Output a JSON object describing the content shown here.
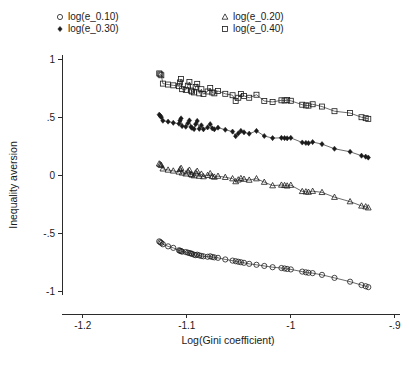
{
  "chart_data": {
    "type": "scatter",
    "title": "",
    "xlabel": "Log(Gini coefficient)",
    "ylabel": "Inequality aversion",
    "xlim": [
      -1.22,
      -0.895
    ],
    "ylim": [
      -1.12,
      1.08
    ],
    "xticks": [
      -1.2,
      -1.1,
      -1.0,
      -0.9
    ],
    "xtick_labels": [
      "-1.2",
      "-1.1",
      "-1",
      "-.9"
    ],
    "yticks": [
      1.0,
      0.5,
      0.0,
      -0.5,
      -1.0
    ],
    "ytick_labels": [
      "1",
      ".5",
      "0",
      "-.5",
      "-1"
    ],
    "grid": false,
    "legend_position": "top",
    "series": [
      {
        "name": "log(e_0.10)",
        "marker": "circle-open",
        "legend_column": "left",
        "legend_row": 1,
        "points": [
          [
            -1.1265,
            -0.571
          ],
          [
            -1.1255,
            -0.578
          ],
          [
            -1.1245,
            -0.585
          ],
          [
            -1.123,
            -0.596
          ],
          [
            -1.118,
            -0.614
          ],
          [
            -1.113,
            -0.627
          ],
          [
            -1.1075,
            -0.648
          ],
          [
            -1.1065,
            -0.652
          ],
          [
            -1.1055,
            -0.655
          ],
          [
            -1.1045,
            -0.66
          ],
          [
            -1.101,
            -0.663
          ],
          [
            -1.099,
            -0.668
          ],
          [
            -1.0975,
            -0.672
          ],
          [
            -1.096,
            -0.675
          ],
          [
            -1.095,
            -0.679
          ],
          [
            -1.093,
            -0.686
          ],
          [
            -1.0915,
            -0.69
          ],
          [
            -1.09,
            -0.686
          ],
          [
            -1.088,
            -0.692
          ],
          [
            -1.086,
            -0.697
          ],
          [
            -1.084,
            -0.7
          ],
          [
            -1.08,
            -0.704
          ],
          [
            -1.0775,
            -0.7
          ],
          [
            -1.0755,
            -0.706
          ],
          [
            -1.0735,
            -0.709
          ],
          [
            -1.07,
            -0.713
          ],
          [
            -1.063,
            -0.727
          ],
          [
            -1.056,
            -0.737
          ],
          [
            -1.053,
            -0.742
          ],
          [
            -1.0505,
            -0.747
          ],
          [
            -1.048,
            -0.751
          ],
          [
            -1.045,
            -0.756
          ],
          [
            -1.04,
            -0.765
          ],
          [
            -1.033,
            -0.773
          ],
          [
            -1.0255,
            -0.783
          ],
          [
            -1.0175,
            -0.794
          ],
          [
            -1.009,
            -0.801
          ],
          [
            -1.006,
            -0.805
          ],
          [
            -1.0035,
            -0.809
          ],
          [
            -1.0,
            -0.813
          ],
          [
            -0.989,
            -0.832
          ],
          [
            -0.9855,
            -0.838
          ],
          [
            -0.983,
            -0.842
          ],
          [
            -0.979,
            -0.845
          ],
          [
            -0.97,
            -0.86
          ],
          [
            -0.958,
            -0.886
          ],
          [
            -0.943,
            -0.919
          ],
          [
            -0.932,
            -0.948
          ],
          [
            -0.928,
            -0.958
          ],
          [
            -0.9255,
            -0.966
          ]
        ]
      },
      {
        "name": "log(e_0.20)",
        "marker": "triangle-open",
        "legend_column": "right",
        "legend_row": 1,
        "points": [
          [
            -1.1265,
            0.098
          ],
          [
            -1.1255,
            0.092
          ],
          [
            -1.1245,
            0.085
          ],
          [
            -1.123,
            0.055
          ],
          [
            -1.118,
            0.045
          ],
          [
            -1.113,
            0.037
          ],
          [
            -1.1075,
            0.028
          ],
          [
            -1.1065,
            0.05
          ],
          [
            -1.1055,
            0.06
          ],
          [
            -1.1045,
            0.02
          ],
          [
            -1.101,
            0.012
          ],
          [
            -1.099,
            0.03
          ],
          [
            -1.0975,
            0.044
          ],
          [
            -1.096,
            0.008
          ],
          [
            -1.095,
            0.002
          ],
          [
            -1.093,
            -0.004
          ],
          [
            -1.0915,
            0.02
          ],
          [
            -1.09,
            0.035
          ],
          [
            -1.088,
            -0.008
          ],
          [
            -1.086,
            0.01
          ],
          [
            -1.084,
            -0.012
          ],
          [
            -1.08,
            -0.001
          ],
          [
            -1.0775,
            0.014
          ],
          [
            -1.0755,
            -0.01
          ],
          [
            -1.0735,
            -0.016
          ],
          [
            -1.07,
            -0.008
          ],
          [
            -1.063,
            -0.018
          ],
          [
            -1.056,
            -0.03
          ],
          [
            -1.053,
            -0.055
          ],
          [
            -1.0505,
            -0.04
          ],
          [
            -1.048,
            -0.028
          ],
          [
            -1.045,
            -0.034
          ],
          [
            -1.04,
            -0.042
          ],
          [
            -1.033,
            -0.03
          ],
          [
            -1.0255,
            -0.06
          ],
          [
            -1.0175,
            -0.09
          ],
          [
            -1.009,
            -0.085
          ],
          [
            -1.006,
            -0.088
          ],
          [
            -1.0035,
            -0.092
          ],
          [
            -1.0,
            -0.086
          ],
          [
            -0.989,
            -0.14
          ],
          [
            -0.9855,
            -0.143
          ],
          [
            -0.983,
            -0.146
          ],
          [
            -0.979,
            -0.138
          ],
          [
            -0.97,
            -0.148
          ],
          [
            -0.958,
            -0.19
          ],
          [
            -0.943,
            -0.228
          ],
          [
            -0.932,
            -0.265
          ],
          [
            -0.928,
            -0.272
          ],
          [
            -0.9255,
            -0.281
          ]
        ]
      },
      {
        "name": "log(e_0.30)",
        "marker": "diamond-filled",
        "legend_column": "left",
        "legend_row": 2,
        "points": [
          [
            -1.1265,
            0.522
          ],
          [
            -1.1255,
            0.512
          ],
          [
            -1.1245,
            0.5
          ],
          [
            -1.123,
            0.47
          ],
          [
            -1.118,
            0.462
          ],
          [
            -1.113,
            0.452
          ],
          [
            -1.1075,
            0.444
          ],
          [
            -1.1065,
            0.472
          ],
          [
            -1.1055,
            0.49
          ],
          [
            -1.1045,
            0.424
          ],
          [
            -1.101,
            0.418
          ],
          [
            -1.099,
            0.448
          ],
          [
            -1.0975,
            0.472
          ],
          [
            -1.096,
            0.416
          ],
          [
            -1.095,
            0.408
          ],
          [
            -1.093,
            0.398
          ],
          [
            -1.0915,
            0.44
          ],
          [
            -1.09,
            0.468
          ],
          [
            -1.088,
            0.4
          ],
          [
            -1.086,
            0.43
          ],
          [
            -1.084,
            0.396
          ],
          [
            -1.08,
            0.412
          ],
          [
            -1.0775,
            0.44
          ],
          [
            -1.0755,
            0.404
          ],
          [
            -1.0735,
            0.396
          ],
          [
            -1.07,
            0.41
          ],
          [
            -1.063,
            0.392
          ],
          [
            -1.056,
            0.376
          ],
          [
            -1.053,
            0.336
          ],
          [
            -1.0505,
            0.36
          ],
          [
            -1.048,
            0.382
          ],
          [
            -1.045,
            0.37
          ],
          [
            -1.04,
            0.358
          ],
          [
            -1.033,
            0.382
          ],
          [
            -1.0255,
            0.338
          ],
          [
            -1.0175,
            0.32
          ],
          [
            -1.009,
            0.322
          ],
          [
            -1.006,
            0.32
          ],
          [
            -1.0035,
            0.318
          ],
          [
            -1.0,
            0.322
          ],
          [
            -0.989,
            0.282
          ],
          [
            -0.9855,
            0.278
          ],
          [
            -0.983,
            0.276
          ],
          [
            -0.979,
            0.286
          ],
          [
            -0.97,
            0.268
          ],
          [
            -0.958,
            0.228
          ],
          [
            -0.943,
            0.202
          ],
          [
            -0.932,
            0.168
          ],
          [
            -0.928,
            0.16
          ],
          [
            -0.9255,
            0.152
          ]
        ]
      },
      {
        "name": "log(e_0.40)",
        "marker": "square-open",
        "legend_column": "right",
        "legend_row": 2,
        "points": [
          [
            -1.1265,
            0.878
          ],
          [
            -1.1255,
            0.87
          ],
          [
            -1.1245,
            0.862
          ],
          [
            -1.123,
            0.79
          ],
          [
            -1.118,
            0.782
          ],
          [
            -1.113,
            0.775
          ],
          [
            -1.1075,
            0.768
          ],
          [
            -1.1065,
            0.8
          ],
          [
            -1.1055,
            0.83
          ],
          [
            -1.1045,
            0.742
          ],
          [
            -1.101,
            0.736
          ],
          [
            -1.099,
            0.772
          ],
          [
            -1.0975,
            0.804
          ],
          [
            -1.096,
            0.73
          ],
          [
            -1.095,
            0.722
          ],
          [
            -1.093,
            0.714
          ],
          [
            -1.0915,
            0.76
          ],
          [
            -1.09,
            0.788
          ],
          [
            -1.088,
            0.706
          ],
          [
            -1.086,
            0.742
          ],
          [
            -1.084,
            0.7
          ],
          [
            -1.08,
            0.722
          ],
          [
            -1.0775,
            0.752
          ],
          [
            -1.0755,
            0.714
          ],
          [
            -1.0735,
            0.706
          ],
          [
            -1.07,
            0.726
          ],
          [
            -1.063,
            0.702
          ],
          [
            -1.056,
            0.69
          ],
          [
            -1.053,
            0.64
          ],
          [
            -1.0505,
            0.668
          ],
          [
            -1.048,
            0.7
          ],
          [
            -1.045,
            0.684
          ],
          [
            -1.04,
            0.668
          ],
          [
            -1.033,
            0.694
          ],
          [
            -1.0255,
            0.64
          ],
          [
            -1.0175,
            0.632
          ],
          [
            -1.009,
            0.646
          ],
          [
            -1.006,
            0.644
          ],
          [
            -1.0035,
            0.648
          ],
          [
            -1.0,
            0.642
          ],
          [
            -0.989,
            0.608
          ],
          [
            -0.9855,
            0.602
          ],
          [
            -0.983,
            0.6
          ],
          [
            -0.979,
            0.612
          ],
          [
            -0.97,
            0.592
          ],
          [
            -0.958,
            0.552
          ],
          [
            -0.943,
            0.536
          ],
          [
            -0.932,
            0.5
          ],
          [
            -0.928,
            0.492
          ],
          [
            -0.9255,
            0.486
          ]
        ]
      }
    ]
  },
  "caption": {
    "partial_text": ""
  }
}
